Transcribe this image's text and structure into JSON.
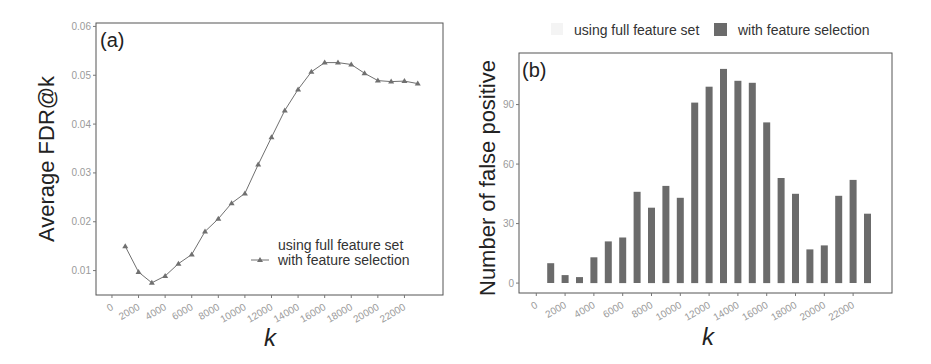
{
  "chart_data": [
    {
      "id": "a",
      "type": "line",
      "panel_label": "(a)",
      "title": "",
      "xlabel": "k",
      "ylabel": "Average FDR@k",
      "x": [
        1000,
        2000,
        3000,
        4000,
        5000,
        6000,
        7000,
        8000,
        9000,
        10000,
        11000,
        12000,
        13000,
        14000,
        15000,
        16000,
        17000,
        18000,
        19000,
        20000,
        21000,
        22000,
        23000
      ],
      "series": [
        {
          "name": "using full feature set",
          "values": [],
          "color": "#f2f2f2",
          "marker": "none"
        },
        {
          "name": "with feature selection",
          "values": [
            0.015,
            0.0097,
            0.0075,
            0.0089,
            0.0114,
            0.0133,
            0.018,
            0.0206,
            0.0238,
            0.0258,
            0.0317,
            0.0373,
            0.0428,
            0.0471,
            0.0507,
            0.0526,
            0.0526,
            0.0522,
            0.0504,
            0.0489,
            0.0487,
            0.0488,
            0.0483
          ],
          "color": "#707070",
          "marker": "triangle"
        }
      ],
      "xticks": [
        0,
        2000,
        4000,
        6000,
        8000,
        10000,
        12000,
        14000,
        16000,
        18000,
        20000,
        22000
      ],
      "yticks": [
        0.01,
        0.02,
        0.03,
        0.04,
        0.05,
        0.06
      ],
      "ytick_labels": [
        "0.01",
        "0.02",
        "0.03",
        "0.04",
        "0.05",
        "0.06"
      ],
      "xlim": [
        -1200,
        24900
      ],
      "ylim": [
        0.005,
        0.0607
      ],
      "grid": false,
      "legend_position": "inside-bottom-right"
    },
    {
      "id": "b",
      "type": "bar",
      "panel_label": "(b)",
      "title": "",
      "xlabel": "k",
      "ylabel": "Number of false positive",
      "x": [
        1000,
        2000,
        3000,
        4000,
        5000,
        6000,
        7000,
        8000,
        9000,
        10000,
        11000,
        12000,
        13000,
        14000,
        15000,
        16000,
        17000,
        18000,
        19000,
        20000,
        21000,
        22000,
        23000
      ],
      "series": [
        {
          "name": "using full feature set",
          "values": [],
          "color": "#f4f4f4"
        },
        {
          "name": "with feature selection",
          "values": [
            10,
            4,
            3,
            13,
            21,
            23,
            46,
            38,
            49,
            43,
            91,
            99,
            108,
            102,
            101,
            81,
            53,
            45,
            17,
            19,
            44,
            52,
            35
          ],
          "color": "#6b6b6b"
        }
      ],
      "xticks": [
        0,
        2000,
        4000,
        6000,
        8000,
        10000,
        12000,
        14000,
        16000,
        18000,
        20000,
        22000
      ],
      "yticks": [
        0,
        30,
        60,
        90
      ],
      "ytick_labels": [
        "0",
        "30",
        "60",
        "90"
      ],
      "xlim": [
        -1200,
        24700
      ],
      "ylim": [
        -5,
        116
      ],
      "grid": false,
      "legend_position": "top"
    }
  ],
  "panels": {
    "a": {
      "label": "(a)",
      "ylabel": "Average FDR@k",
      "xlabel": "k",
      "legend": [
        "using full feature set",
        "with feature selection"
      ]
    },
    "b": {
      "label": "(b)",
      "ylabel": "Number of false positive",
      "xlabel": "k",
      "legend": [
        "using full feature set",
        "with feature selection"
      ]
    }
  }
}
